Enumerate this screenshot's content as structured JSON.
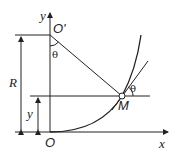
{
  "diagram": {
    "labels": {
      "y_axis": "y",
      "x_axis": "x",
      "origin": "O",
      "center": "O'",
      "radius": "R",
      "height": "y",
      "point": "M",
      "angle_top": "θ",
      "angle_point": "θ"
    },
    "colors": {
      "line": "#222222",
      "background": "#ffffff"
    }
  }
}
